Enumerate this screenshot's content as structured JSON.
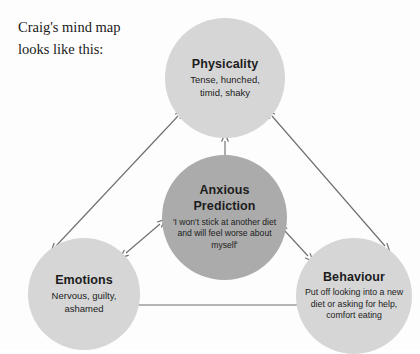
{
  "heading": {
    "line1": "Craig's mind map",
    "line2": "looks like this:"
  },
  "colors": {
    "outer_node_fill": "#d6d6d6",
    "center_node_fill": "#ababab",
    "arrow": "#6f6f73",
    "text": "#1c1c1c",
    "background": "#fdfdfd"
  },
  "nodes": {
    "physicality": {
      "title": "Physicality",
      "description": "Tense, hunched, timid, shaky"
    },
    "anxious_prediction": {
      "title_line1": "Anxious",
      "title_line2": "Prediction",
      "description": "'I won't stick at another diet and will feel worse about myself'"
    },
    "emotions": {
      "title": "Emotions",
      "description": "Nervous, guilty, ashamed"
    },
    "behaviour": {
      "title": "Behaviour",
      "description": "Put off looking into a new diet or asking for help, comfort eating"
    }
  },
  "connections": [
    {
      "name": "physicality-emotions",
      "from": "Physicality",
      "to": "Emotions",
      "style": "double-arrow"
    },
    {
      "name": "physicality-behaviour",
      "from": "Physicality",
      "to": "Behaviour",
      "style": "double-arrow"
    },
    {
      "name": "emotions-behaviour",
      "from": "Emotions",
      "to": "Behaviour",
      "style": "double-arrow"
    },
    {
      "name": "physicality-anxious-prediction",
      "from": "Physicality",
      "to": "Anxious Prediction",
      "style": "double-arrow"
    },
    {
      "name": "emotions-anxious-prediction",
      "from": "Emotions",
      "to": "Anxious Prediction",
      "style": "double-arrow"
    },
    {
      "name": "behaviour-anxious-prediction",
      "from": "Behaviour",
      "to": "Anxious Prediction",
      "style": "double-arrow"
    }
  ]
}
